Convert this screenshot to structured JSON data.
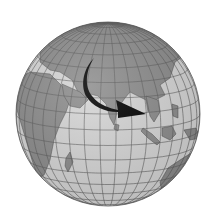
{
  "image": {
    "description": "Grayscale orthographic globe centered on the Indian Ocean with a black curved arrow pointing from Central Asia toward Southeast Asia",
    "colors": {
      "background": "#ffffff",
      "ocean": "#d6d6d6",
      "land": "#8c8c8c",
      "grid": "#5a5a5a",
      "border": "#4a4a4a",
      "arrow": "#000000"
    },
    "regions": [
      "Europe",
      "Africa",
      "Middle East",
      "India",
      "Central Asia",
      "China",
      "Southeast Asia",
      "Indonesia",
      "Australia",
      "Indian Ocean"
    ],
    "arrow": {
      "from": "Central Asia",
      "to": "Southeast Asia",
      "shape": "curved"
    }
  }
}
